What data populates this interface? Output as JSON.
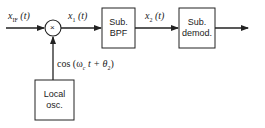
{
  "diagram": {
    "signals": {
      "input": "x_IF (t)",
      "input_main": "x",
      "input_sub": "IF",
      "input_arg": "(t)",
      "mixed": "x",
      "mixed_sub": "1",
      "mixed_arg": "(t)",
      "filtered": "x",
      "filtered_sub": "2",
      "filtered_arg": "(t)",
      "lo_signal": "cos (ω_c t + θ_2)",
      "lo_prefix": "cos (ω",
      "lo_sub_c": "c",
      "lo_mid": " t + θ",
      "lo_sub_2": "2",
      "lo_suffix": ")"
    },
    "mixer_symbol": "×",
    "blocks": {
      "bpf": {
        "line1": "Sub.",
        "line2": "BPF"
      },
      "demod": {
        "line1": "Sub.",
        "line2": "demod."
      },
      "lo": {
        "line1": "Local",
        "line2": "osc."
      }
    }
  }
}
